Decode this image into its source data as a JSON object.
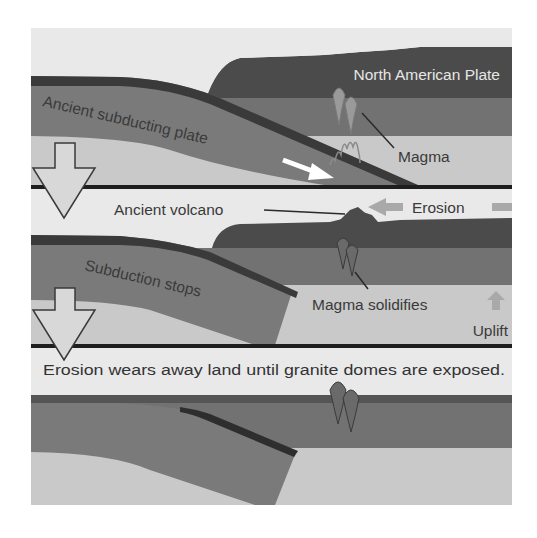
{
  "diagram": {
    "title": "",
    "panels": [
      {
        "stage": 1,
        "labels": {
          "plate": "North American Plate",
          "subducting": "Ancient subducting plate",
          "magma": "Magma"
        }
      },
      {
        "stage": 2,
        "labels": {
          "volcano": "Ancient volcano",
          "erosion": "Erosion",
          "subduction_stops": "Subduction stops",
          "magma_solidifies": "Magma solidifies",
          "uplift": "Uplift"
        }
      },
      {
        "stage": 3,
        "labels": {
          "caption": "Erosion wears away land until granite domes are exposed."
        }
      }
    ],
    "icons": {
      "stage_arrow": "down-arrow-icon",
      "motion_arrow": "right-down-arrow-icon",
      "erosion_arrow": "left-arrow-icon",
      "uplift_arrow": "up-arrow-icon",
      "magma": "magma-plume-icon",
      "granite_dome": "granite-dome-icon"
    },
    "colors": {
      "background": "#ffffff",
      "sky": "#e9e9e9",
      "crust_dark": "#4b4b4b",
      "crust_mid": "#727272",
      "mantle_light": "#c9c9c9",
      "plate_mid": "#7a7a7a",
      "plate_edge": "#262626",
      "separator": "#1e1e1e",
      "erosion_arrow": "#a9a9a9",
      "motion_arrow": "#ffffff",
      "stage_arrow_fill": "#d8d8d8"
    }
  }
}
